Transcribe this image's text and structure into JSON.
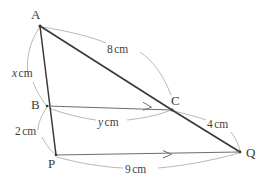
{
  "figure": {
    "kind": "geometry-diagram",
    "stroke_color_thick": "#3a3a3a",
    "stroke_color_thin": "#6e6e6e",
    "arc_color": "#9a9a9a",
    "background": "#ffffff"
  },
  "vertices": [
    {
      "id": "A",
      "label": "A",
      "x": 40,
      "y": 26,
      "label_x": 31,
      "label_y": 8
    },
    {
      "id": "B",
      "label": "B",
      "x": 47,
      "y": 106,
      "label_x": 31,
      "label_y": 98
    },
    {
      "id": "P",
      "label": "P",
      "x": 56,
      "y": 155,
      "label_x": 48,
      "label_y": 157
    },
    {
      "id": "C",
      "label": "C",
      "x": 172,
      "y": 110,
      "label_x": 171,
      "label_y": 94
    },
    {
      "id": "Q",
      "label": "Q",
      "x": 240,
      "y": 152,
      "label_x": 246,
      "label_y": 146
    }
  ],
  "segments": [
    {
      "id": "AC",
      "from": "A",
      "to": "C",
      "style": "thick",
      "arrow": false
    },
    {
      "id": "AP",
      "from": "A",
      "to": "P",
      "style": "thick",
      "arrow": false
    },
    {
      "id": "CQ",
      "from": "C",
      "to": "Q",
      "style": "thick",
      "arrow": false
    },
    {
      "id": "BC",
      "from": "B",
      "to": "C",
      "style": "thin",
      "arrow": true
    },
    {
      "id": "PQ",
      "from": "P",
      "to": "Q",
      "style": "thin",
      "arrow": true
    }
  ],
  "measurements": [
    {
      "id": "AB",
      "segment": "AB",
      "value": "x",
      "unit": "cm",
      "is_variable": true,
      "label_x": 12,
      "label_y": 68
    },
    {
      "id": "BP",
      "segment": "BP",
      "value": "2",
      "unit": "cm",
      "is_variable": false,
      "label_x": 15,
      "label_y": 126
    },
    {
      "id": "AC",
      "segment": "AC",
      "value": "8",
      "unit": "cm",
      "is_variable": false,
      "label_x": 107,
      "label_y": 44
    },
    {
      "id": "BC",
      "segment": "BC",
      "value": "y",
      "unit": "cm",
      "is_variable": true,
      "label_x": 98,
      "label_y": 117
    },
    {
      "id": "CQ",
      "segment": "CQ",
      "value": "4",
      "unit": "cm",
      "is_variable": false,
      "label_x": 207,
      "label_y": 119
    },
    {
      "id": "PQ",
      "segment": "PQ",
      "value": "9",
      "unit": "cm",
      "is_variable": false,
      "label_x": 125,
      "label_y": 164
    }
  ]
}
